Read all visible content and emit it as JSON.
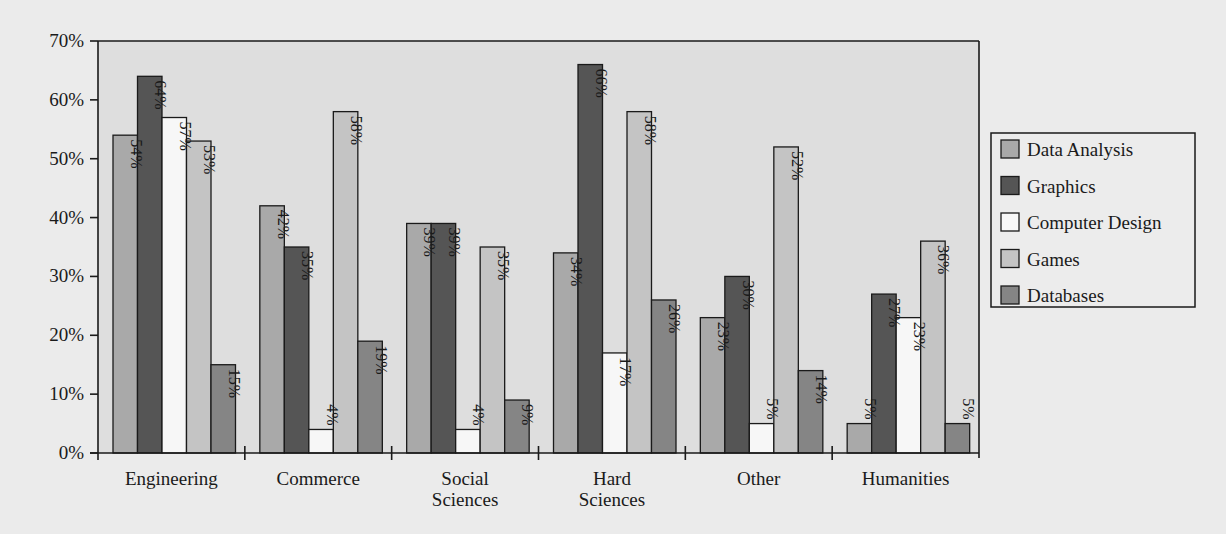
{
  "chart_data": {
    "type": "bar",
    "title": "",
    "xlabel": "",
    "ylabel": "",
    "ylim": [
      0,
      70
    ],
    "yticks": [
      "0%",
      "10%",
      "20%",
      "30%",
      "40%",
      "50%",
      "60%",
      "70%"
    ],
    "grid": false,
    "legend_position": "right",
    "categories": [
      "Engineering",
      "Commerce",
      "Social Sciences",
      "Hard Sciences",
      "Other",
      "Humanities"
    ],
    "category_lines": [
      [
        "Engineering"
      ],
      [
        "Commerce"
      ],
      [
        "Social",
        "Sciences"
      ],
      [
        "Hard",
        "Sciences"
      ],
      [
        "Other"
      ],
      [
        "Humanities"
      ]
    ],
    "series": [
      {
        "name": "Data Analysis",
        "color": "#a9a9a9",
        "values": [
          54,
          42,
          39,
          34,
          23,
          5
        ]
      },
      {
        "name": "Graphics",
        "color": "#555555",
        "values": [
          64,
          35,
          39,
          66,
          30,
          27
        ]
      },
      {
        "name": "Computer Design",
        "color": "#f7f7f7",
        "values": [
          57,
          4,
          4,
          17,
          5,
          23
        ]
      },
      {
        "name": "Games",
        "color": "#c4c4c4",
        "values": [
          53,
          58,
          35,
          58,
          52,
          36
        ]
      },
      {
        "name": "Databases",
        "color": "#858585",
        "values": [
          15,
          19,
          9,
          26,
          14,
          5
        ]
      }
    ],
    "value_suffix": "%"
  },
  "colors": {
    "background": "#ebebeb",
    "plot_background": "#dedede",
    "axis": "#1a1a1a"
  }
}
